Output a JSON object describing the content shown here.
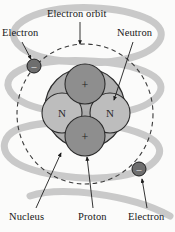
{
  "diagram": {
    "background_color": "#fbfbfa",
    "labels": {
      "electron_orbit": "Electron orbit",
      "electron_top": "Electron",
      "neutron": "Neutron",
      "nucleus": "Nucleus",
      "proton": "Proton",
      "electron_bottom": "Electron"
    },
    "colors": {
      "helix": "#c9c9c9",
      "nucleus_fill": "#a8a8a8",
      "proton_fill": "#8e8e8e",
      "neutron_fill": "#bdbdbd",
      "electron_fill": "#6e6e6e",
      "outline": "#2b2b2b",
      "orbit_dash": "#3a3a3a",
      "text": "#171717"
    },
    "orbit": {
      "center_x": 85,
      "center_y": 114,
      "radius_x": 68,
      "radius_y": 70,
      "style": "dashed"
    },
    "nucleus": {
      "center_x": 85,
      "center_y": 108,
      "radius": 40
    },
    "nucleons": [
      {
        "type": "proton",
        "glyph": "+",
        "cx": 85,
        "cy": 84,
        "r": 20
      },
      {
        "type": "neutron",
        "glyph": "N",
        "cx": 62,
        "cy": 113,
        "r": 20
      },
      {
        "type": "neutron",
        "glyph": "N",
        "cx": 110,
        "cy": 113,
        "r": 20
      },
      {
        "type": "proton",
        "glyph": "+",
        "cx": 85,
        "cy": 136,
        "r": 20
      }
    ],
    "electrons": [
      {
        "glyph": "–",
        "cx": 34,
        "cy": 66,
        "r": 7
      },
      {
        "glyph": "–",
        "cx": 139,
        "cy": 169,
        "r": 7
      }
    ]
  }
}
